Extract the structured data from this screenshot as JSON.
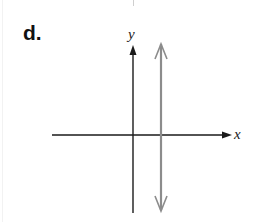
{
  "figure": {
    "part_label": "d.",
    "axes": {
      "x_label": "x",
      "y_label": "y"
    },
    "graph": {
      "description": "Vertical line crossing the positive x-axis (line of the form x = a, a > 0)",
      "line_type": "vertical",
      "arrows": "both ends",
      "color": "#8c8c8c"
    },
    "axis_color": "#1a1a1a"
  }
}
